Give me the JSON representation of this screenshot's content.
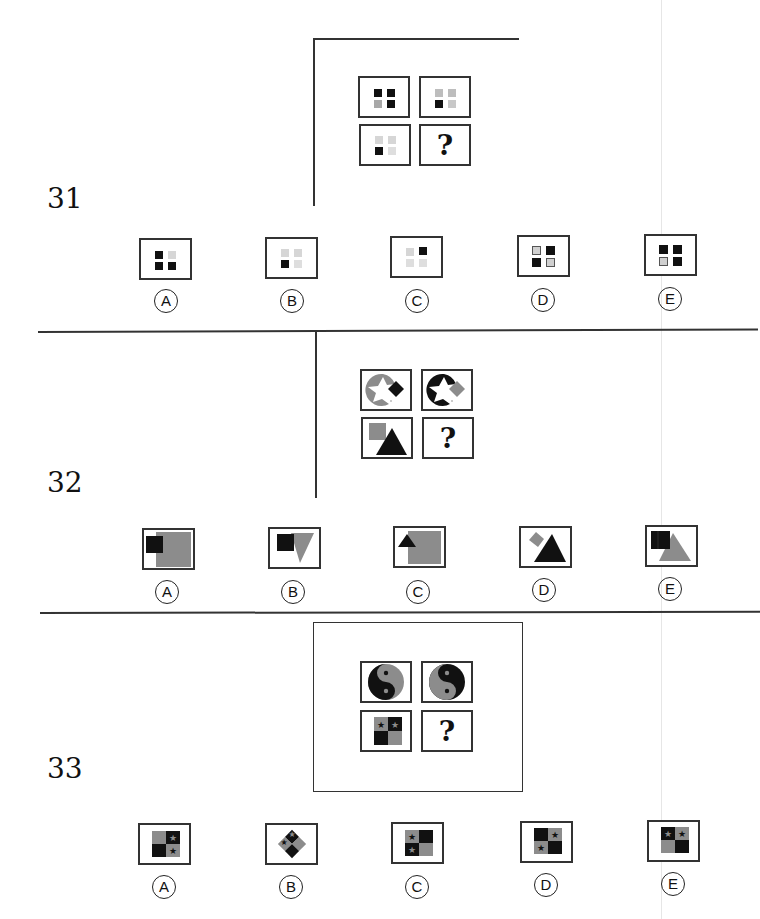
{
  "colors": {
    "black": "#111111",
    "gray": "#8c8c8c",
    "midgray": "#a8a8a8",
    "lightgray": "#d4d4d4",
    "line": "#333333"
  },
  "questions": [
    {
      "number": "31",
      "grid": [
        {
          "pattern": [
            "black",
            "black",
            "midgray",
            "black"
          ]
        },
        {
          "pattern": [
            "midgray",
            "midgray",
            "black",
            "lightgray"
          ]
        },
        {
          "pattern": [
            "lightgray",
            "lightgray",
            "black",
            "lightgray"
          ]
        },
        {
          "unknown": "?"
        }
      ],
      "options": [
        {
          "label": "A",
          "pattern": [
            "black",
            "lightgray",
            "black",
            "black"
          ]
        },
        {
          "label": "B",
          "pattern": [
            "lightgray",
            "lightgray",
            "black",
            "lightgray"
          ]
        },
        {
          "label": "C",
          "pattern": [
            "lightgray",
            "black",
            "lightgray",
            "lightgray"
          ]
        },
        {
          "label": "D",
          "pattern": [
            "outlined-lightgray",
            "black",
            "black",
            "outlined-lightgray"
          ]
        },
        {
          "label": "E",
          "pattern": [
            "black",
            "black",
            "outlined-lightgray",
            "black"
          ]
        }
      ]
    },
    {
      "number": "32",
      "grid": [
        {
          "shape": "gray-circle-with-star-cutout-black-diamond"
        },
        {
          "shape": "black-circle-with-star-cutout-gray-diamond"
        },
        {
          "shape": "gray-square-behind-black-triangle"
        },
        {
          "unknown": "?"
        }
      ],
      "options": [
        {
          "label": "A",
          "shape": "black-square-over-gray-square"
        },
        {
          "label": "B",
          "shape": "black-square-over-gray-inverted-triangle"
        },
        {
          "label": "C",
          "shape": "black-triangle-over-gray-square"
        },
        {
          "label": "D",
          "shape": "gray-diamond-behind-black-triangle"
        },
        {
          "label": "E",
          "shape": "black-rectangle-over-gray-triangle"
        }
      ]
    },
    {
      "number": "33",
      "grid": [
        {
          "shape": "yin-yang-black-left"
        },
        {
          "shape": "yin-yang-gray-left"
        },
        {
          "shape": "quad-square-gray-star-black-star-black-gray"
        },
        {
          "unknown": "?"
        }
      ],
      "options": [
        {
          "label": "A",
          "shape": "quad-square-gray-black-star-black-gray-star"
        },
        {
          "label": "B",
          "shape": "quad-diamond-stars"
        },
        {
          "label": "C",
          "shape": "quad-square-gray-star-black-black-star-gray"
        },
        {
          "label": "D",
          "shape": "quad-square-black-gray-star-gray-star-black"
        },
        {
          "label": "E",
          "shape": "quad-square-black-star-gray-star-gray-black"
        }
      ]
    }
  ]
}
